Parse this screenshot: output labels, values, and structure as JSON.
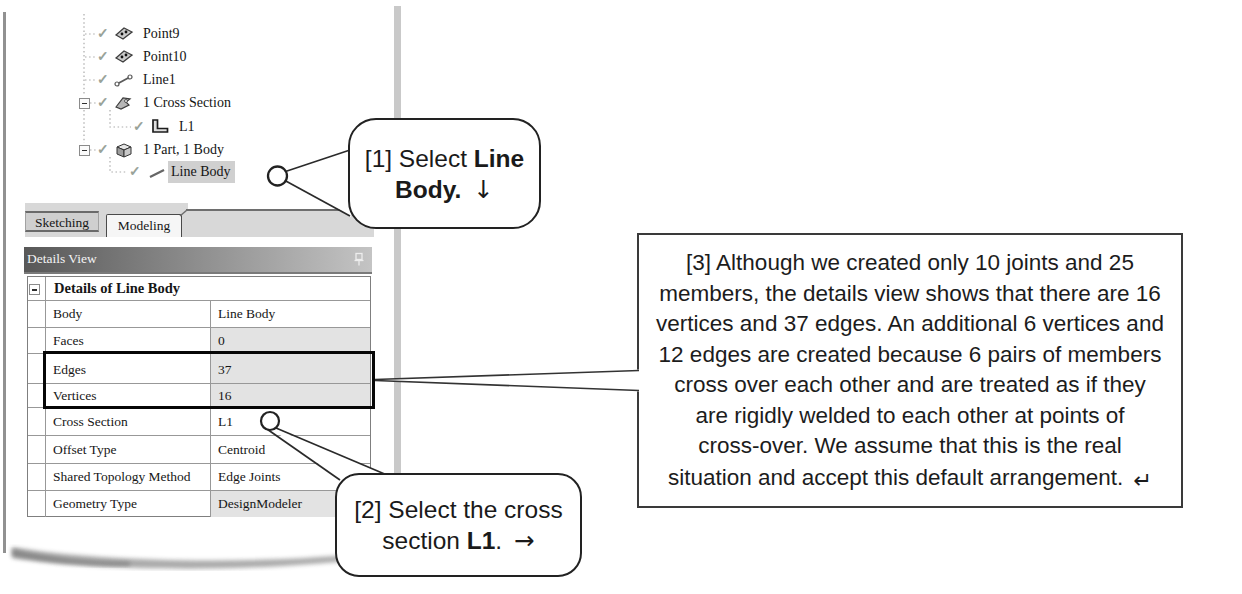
{
  "window": {
    "details_panel_title": "Details View",
    "tabs": [
      {
        "label": "Sketching",
        "active": false
      },
      {
        "label": "Modeling",
        "active": true
      }
    ]
  },
  "tree": {
    "items": [
      {
        "label": "Point9",
        "icon": "point-icon",
        "checked": true
      },
      {
        "label": "Point10",
        "icon": "point-icon",
        "checked": true
      },
      {
        "label": "Line1",
        "icon": "line-icon",
        "checked": true
      },
      {
        "label": "1 Cross Section",
        "icon": "cross-section-icon",
        "checked": true,
        "expanded": true
      },
      {
        "label": "L1",
        "icon": "l-profile-icon",
        "checked": true
      },
      {
        "label": "1 Part, 1 Body",
        "icon": "part-icon",
        "checked": true,
        "expanded": true
      },
      {
        "label": "Line Body",
        "icon": "line-body-icon",
        "checked": true,
        "selected": true
      }
    ]
  },
  "details_table": {
    "group_header": "Details of Line Body",
    "rows": [
      {
        "label": "Body",
        "value": "Line Body",
        "shaded": false,
        "boxed": false
      },
      {
        "label": "Faces",
        "value": "0",
        "shaded": true,
        "boxed": false
      },
      {
        "label": "Edges",
        "value": "37",
        "shaded": true,
        "boxed": true
      },
      {
        "label": "Vertices",
        "value": "16",
        "shaded": true,
        "boxed": true
      },
      {
        "label": "Cross Section",
        "value": "L1",
        "shaded": false,
        "boxed": false
      },
      {
        "label": "Offset Type",
        "value": "Centroid",
        "shaded": false,
        "boxed": false
      },
      {
        "label": "Shared Topology Method",
        "value": "Edge Joints",
        "shaded": false,
        "boxed": false
      },
      {
        "label": "Geometry Type",
        "value": "DesignModeler",
        "shaded": true,
        "boxed": false
      }
    ]
  },
  "callouts": {
    "c1": {
      "prefix": "[1] Select ",
      "bold": "Line Body",
      "suffix": ".",
      "arrow": "↓"
    },
    "c2": {
      "prefix": "[2] Select the cross section ",
      "bold": "L1",
      "suffix": ".",
      "arrow": "→"
    },
    "c3": {
      "text": "[3] Although we created only 10 joints and 25\nmembers, the details view shows that there are 16\nvertices and 37 edges. An additional 6 vertices and\n12 edges are created because 6 pairs of members\ncross over each other and are treated as if they\nare rigidly welded to each other at points of\ncross-over. We assume that this is the real\nsituation and accept this default arrangement.",
      "arrow": "↵"
    }
  },
  "glyphs": {
    "check": "✓"
  },
  "colors": {
    "selected_item_bg": "#d0d0d0",
    "shaded_cell_bg": "#e3e3e3",
    "titlebar_gradient_left": "#585858",
    "titlebar_gradient_right": "#c4c4c4",
    "highlight_box_border": "#060606",
    "callout_border": "#222222"
  }
}
